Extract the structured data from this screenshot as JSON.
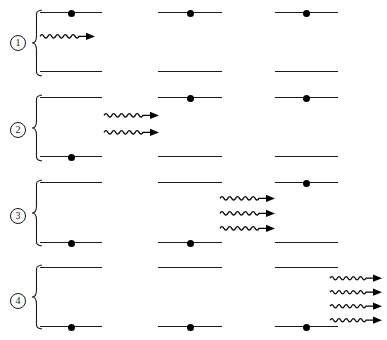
{
  "figure": {
    "width": 387,
    "height": 340,
    "background_color": "#ffffff",
    "line_color": "#1a1a1a",
    "electron_color": "#000000",
    "photon_color": "#000000"
  },
  "legend": {
    "level_upper_name": "excited energy level",
    "level_lower_name": "ground energy level",
    "electron_name": "electron",
    "photon_name": "photon"
  },
  "steps": [
    {
      "label": "1",
      "marker_text": "①",
      "y": 8,
      "height": 80,
      "marker_x": 10,
      "marker_y": 35,
      "brace": {
        "x": 32,
        "y": 10,
        "width": 10,
        "height": 66
      },
      "atoms": [
        {
          "name": "atom-1",
          "x": 40,
          "width": 62,
          "upper_y": 12,
          "lower_y": 71,
          "electron_on": "upper"
        },
        {
          "name": "atom-2",
          "x": 158,
          "width": 64,
          "upper_y": 12,
          "lower_y": 71,
          "electron_on": "upper"
        },
        {
          "name": "atom-3",
          "x": 275,
          "width": 63,
          "upper_y": 12,
          "lower_y": 71,
          "electron_on": "upper"
        }
      ],
      "photon_group": {
        "x": 40,
        "y": 36,
        "count": 1,
        "spacing": 16,
        "length": 55,
        "cycles": 5,
        "amplitude": 3.4
      },
      "photon_count": 1
    },
    {
      "label": "2",
      "marker_text": "②",
      "y": 92,
      "height": 80,
      "marker_x": 10,
      "marker_y": 122,
      "brace": {
        "x": 32,
        "y": 95,
        "width": 10,
        "height": 66
      },
      "atoms": [
        {
          "name": "atom-1",
          "x": 40,
          "width": 62,
          "upper_y": 97,
          "lower_y": 156,
          "electron_on": "lower"
        },
        {
          "name": "atom-2",
          "x": 158,
          "width": 64,
          "upper_y": 97,
          "lower_y": 156,
          "electron_on": "upper"
        },
        {
          "name": "atom-3",
          "x": 275,
          "width": 63,
          "upper_y": 97,
          "lower_y": 156,
          "electron_on": "upper"
        }
      ],
      "photon_group": {
        "x": 104,
        "y": 115,
        "count": 2,
        "spacing": 17,
        "length": 55,
        "cycles": 5,
        "amplitude": 3.4
      },
      "photon_count": 2
    },
    {
      "label": "3",
      "marker_text": "③",
      "y": 177,
      "height": 82,
      "marker_x": 10,
      "marker_y": 208,
      "brace": {
        "x": 32,
        "y": 180,
        "width": 10,
        "height": 66
      },
      "atoms": [
        {
          "name": "atom-1",
          "x": 40,
          "width": 62,
          "upper_y": 182,
          "lower_y": 242,
          "electron_on": "lower"
        },
        {
          "name": "atom-2",
          "x": 158,
          "width": 64,
          "upper_y": 182,
          "lower_y": 242,
          "electron_on": "lower"
        },
        {
          "name": "atom-3",
          "x": 275,
          "width": 63,
          "upper_y": 182,
          "lower_y": 242,
          "electron_on": "upper"
        }
      ],
      "photon_group": {
        "x": 220,
        "y": 198,
        "count": 3,
        "spacing": 15,
        "length": 55,
        "cycles": 5,
        "amplitude": 3.4
      },
      "photon_count": 3
    },
    {
      "label": "4",
      "marker_text": "④",
      "y": 262,
      "height": 78,
      "marker_x": 10,
      "marker_y": 293,
      "brace": {
        "x": 32,
        "y": 265,
        "width": 10,
        "height": 64
      },
      "atoms": [
        {
          "name": "atom-1",
          "x": 40,
          "width": 62,
          "upper_y": 267,
          "lower_y": 326,
          "electron_on": "lower"
        },
        {
          "name": "atom-2",
          "x": 158,
          "width": 64,
          "upper_y": 267,
          "lower_y": 326,
          "electron_on": "lower"
        },
        {
          "name": "atom-3",
          "x": 275,
          "width": 63,
          "upper_y": 267,
          "lower_y": 326,
          "electron_on": "lower"
        }
      ],
      "photon_group": {
        "x": 330,
        "y": 278,
        "count": 4,
        "spacing": 14,
        "length": 52,
        "cycles": 5,
        "amplitude": 3.2
      },
      "photon_count": 4
    }
  ]
}
